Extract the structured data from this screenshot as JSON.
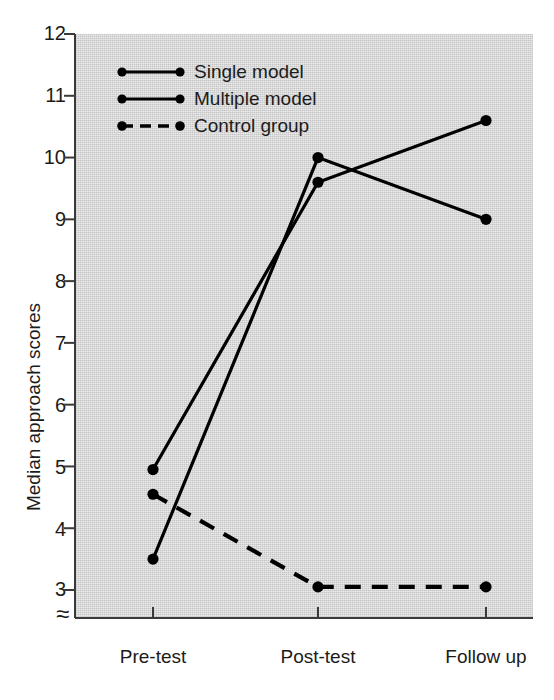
{
  "chart_data": {
    "type": "line",
    "title": "",
    "xlabel": "",
    "ylabel": "Median approach scores",
    "categories": [
      "Pre-test",
      "Post-test",
      "Follow up"
    ],
    "ylim": [
      3,
      12
    ],
    "yticks": [
      3,
      4,
      5,
      6,
      7,
      8,
      9,
      10,
      11,
      12
    ],
    "ytick_labels": [
      "3",
      "4",
      "5",
      "6",
      "7",
      "8",
      "9",
      "10",
      "11",
      "12"
    ],
    "grid": false,
    "axis_break": true,
    "axis_break_symbol": "≈",
    "legend_position": "upper-left-inside",
    "series": [
      {
        "name": "Single model",
        "values": [
          3.5,
          10.0,
          9.0
        ],
        "style": "solid",
        "color": "#000000",
        "marker": "filled-circle"
      },
      {
        "name": "Multiple model",
        "values": [
          4.95,
          9.6,
          10.6
        ],
        "style": "solid",
        "color": "#000000",
        "marker": "filled-circle"
      },
      {
        "name": "Control group",
        "values": [
          4.55,
          3.05,
          3.05
        ],
        "style": "dashed",
        "color": "#000000",
        "marker": "filled-circle"
      }
    ]
  },
  "colors": {
    "plot_background": "#d2d2d2",
    "page_background": "#ffffff",
    "ink": "#1b1b1b",
    "series_ink": "#000000"
  }
}
